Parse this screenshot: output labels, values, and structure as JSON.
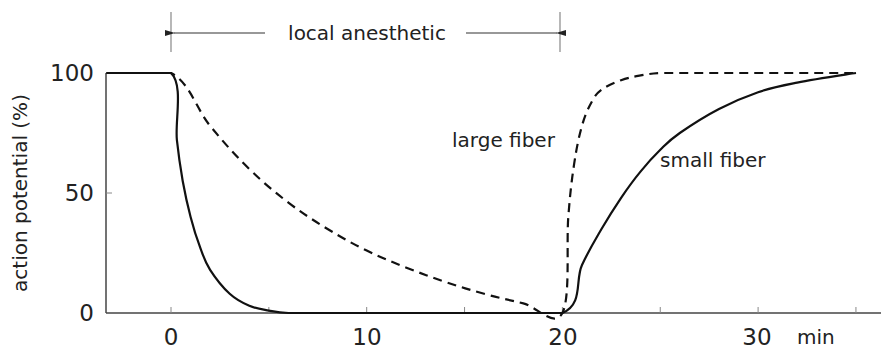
{
  "chart_data": {
    "type": "line",
    "title": "",
    "xlabel": "min",
    "ylabel": "action potential (%)",
    "xlim": [
      -3.3,
      36
    ],
    "ylim": [
      0,
      100
    ],
    "x_ticks": [
      0,
      10,
      20,
      30
    ],
    "x_tick_labels": [
      "0",
      "10",
      "20",
      "30"
    ],
    "x_minor_ticks": [
      5,
      15,
      25,
      35
    ],
    "y_ticks": [
      0,
      50,
      100
    ],
    "y_tick_labels": [
      "0",
      "50",
      "100"
    ],
    "grid": false,
    "legend": "inline labels",
    "annotations": [
      {
        "text": "local anesthetic",
        "type": "bracket-arrow",
        "x_start": 0,
        "x_end": 20
      }
    ],
    "series": [
      {
        "name": "large fiber",
        "style": "dashed",
        "x": [
          -3.3,
          0,
          2,
          4,
          6,
          8,
          10,
          12,
          14,
          16,
          18,
          20,
          20.3,
          20.6,
          21,
          21.5,
          22,
          23,
          24,
          25,
          26,
          28,
          30,
          32,
          35
        ],
        "values": [
          100,
          100,
          78,
          60,
          46,
          35,
          26,
          19,
          13,
          8,
          4,
          0,
          40,
          62,
          78,
          88,
          93,
          97,
          99,
          100,
          100,
          100,
          100,
          100,
          100
        ]
      },
      {
        "name": "small fiber",
        "style": "solid",
        "x": [
          -3.3,
          0,
          0.3,
          0.6,
          1,
          1.5,
          2,
          3,
          4,
          5,
          6,
          8,
          10,
          15,
          20,
          21,
          22,
          23,
          24,
          25,
          26,
          28,
          30,
          32,
          35
        ],
        "values": [
          100,
          100,
          72,
          55,
          40,
          27,
          18,
          8,
          3,
          1,
          0,
          0,
          0,
          0,
          0,
          20,
          35,
          48,
          59,
          68,
          75,
          85,
          92,
          96,
          100
        ]
      }
    ]
  },
  "labels": {
    "y_axis": "action potential (%)",
    "x_unit": "min",
    "bracket": "local anesthetic",
    "large_fiber": "large fiber",
    "small_fiber": "small fiber",
    "y100": "100",
    "y50": "50",
    "y0": "0",
    "x0": "0",
    "x10": "10",
    "x20": "20",
    "x30": "30"
  }
}
